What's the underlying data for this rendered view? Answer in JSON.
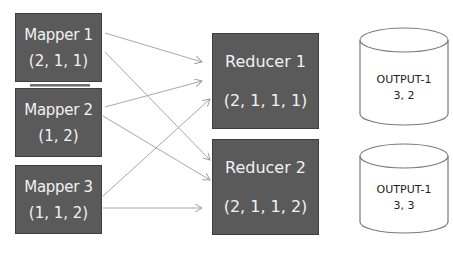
{
  "mappers": [
    {
      "label": "Mapper 1",
      "values": "(2, 1, 1)"
    },
    {
      "label": "Mapper 2",
      "values": "(1, 2)"
    },
    {
      "label": "Mapper 3",
      "values": "(1, 1, 2)"
    }
  ],
  "reducers": [
    {
      "label": "Reducer 1",
      "values": "(2, 1, 1, 1)"
    },
    {
      "label": "Reducer 2",
      "values": "(2, 1, 1, 2)"
    }
  ],
  "outputs": [
    {
      "label": "OUTPUT-1",
      "values": "3, 2"
    },
    {
      "label": "OUTPUT-1",
      "values": "3, 3"
    }
  ],
  "colors": {
    "box_fill": "#5a5a5a",
    "box_text": "#f2f2f2",
    "arrow": "#a0a0a0",
    "cylinder_stroke": "#7a7a7a"
  }
}
